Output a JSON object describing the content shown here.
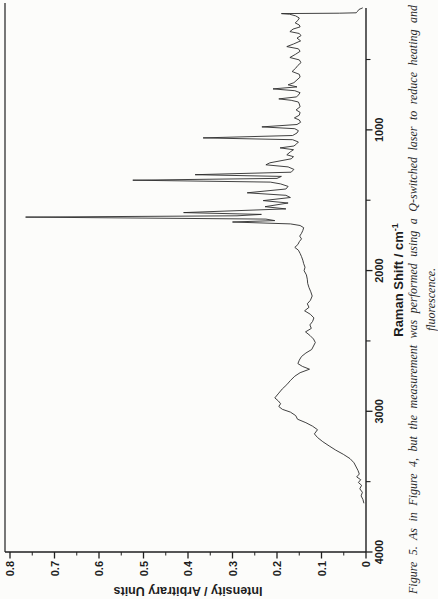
{
  "figure": {
    "caption_line1": "Figure 5. As in Figure 4, but the measurement was performed using a Q-switched laser to reduce heating and",
    "caption_line2": "fluorescence."
  },
  "colors": {
    "background": "#fcfcfa",
    "trace": "#2b2b2b",
    "axis": "#1f1f1f",
    "text": "#1d1d1d"
  },
  "chart_data": {
    "type": "line",
    "orientation_note": "figure printed rotated 90deg counterclockwise on page",
    "x_axis": {
      "title": "Raman Shift / cm",
      "title_superscript": "-1",
      "range": [
        4000,
        134
      ],
      "reversed": true,
      "major_ticks": [
        4000,
        3000,
        2000,
        1000
      ],
      "tick_labels": [
        "4000",
        "3000",
        "2000",
        "1000"
      ],
      "minor_ticks": [
        3500,
        2500,
        1500,
        500
      ]
    },
    "y_axis": {
      "title": "Intensity / Arbitrary Units",
      "range": [
        0,
        0.8
      ],
      "major_ticks": [
        0,
        0.1,
        0.2,
        0.3,
        0.4,
        0.5,
        0.6,
        0.7,
        0.8
      ],
      "tick_labels": [
        "0",
        "0.1",
        "0.2",
        "0.3",
        "0.4",
        "0.5",
        "0.6",
        "0.7",
        "0.8"
      ],
      "minor_tick_step": 0.05
    },
    "grid": false,
    "legend": false,
    "points": [
      [
        134,
        0.008
      ],
      [
        145,
        0.016
      ],
      [
        158,
        0.019
      ],
      [
        168,
        0.022
      ],
      [
        171,
        0.06
      ],
      [
        174,
        0.19
      ],
      [
        178,
        0.172
      ],
      [
        190,
        0.158
      ],
      [
        205,
        0.15
      ],
      [
        222,
        0.153
      ],
      [
        240,
        0.159
      ],
      [
        255,
        0.15
      ],
      [
        268,
        0.148
      ],
      [
        284,
        0.164
      ],
      [
        302,
        0.171
      ],
      [
        315,
        0.15
      ],
      [
        330,
        0.146
      ],
      [
        348,
        0.155
      ],
      [
        368,
        0.147
      ],
      [
        390,
        0.163
      ],
      [
        408,
        0.178
      ],
      [
        424,
        0.152
      ],
      [
        442,
        0.148
      ],
      [
        462,
        0.158
      ],
      [
        486,
        0.171
      ],
      [
        503,
        0.15
      ],
      [
        522,
        0.146
      ],
      [
        542,
        0.153
      ],
      [
        562,
        0.158
      ],
      [
        585,
        0.166
      ],
      [
        605,
        0.15
      ],
      [
        625,
        0.148
      ],
      [
        645,
        0.155
      ],
      [
        665,
        0.162
      ],
      [
        680,
        0.175
      ],
      [
        695,
        0.155
      ],
      [
        709,
        0.209
      ],
      [
        722,
        0.16
      ],
      [
        736,
        0.148
      ],
      [
        752,
        0.152
      ],
      [
        766,
        0.156
      ],
      [
        780,
        0.196
      ],
      [
        790,
        0.168
      ],
      [
        802,
        0.152
      ],
      [
        816,
        0.15
      ],
      [
        836,
        0.148
      ],
      [
        858,
        0.157
      ],
      [
        876,
        0.148
      ],
      [
        896,
        0.15
      ],
      [
        915,
        0.161
      ],
      [
        930,
        0.15
      ],
      [
        946,
        0.147
      ],
      [
        962,
        0.155
      ],
      [
        979,
        0.234
      ],
      [
        992,
        0.16
      ],
      [
        1006,
        0.152
      ],
      [
        1022,
        0.155
      ],
      [
        1040,
        0.165
      ],
      [
        1057,
        0.366
      ],
      [
        1070,
        0.165
      ],
      [
        1086,
        0.152
      ],
      [
        1100,
        0.156
      ],
      [
        1115,
        0.162
      ],
      [
        1128,
        0.193
      ],
      [
        1141,
        0.163
      ],
      [
        1156,
        0.17
      ],
      [
        1177,
        0.178
      ],
      [
        1191,
        0.163
      ],
      [
        1206,
        0.168
      ],
      [
        1234,
        0.216
      ],
      [
        1248,
        0.225
      ],
      [
        1263,
        0.175
      ],
      [
        1281,
        0.162
      ],
      [
        1301,
        0.168
      ],
      [
        1319,
        0.384
      ],
      [
        1331,
        0.19
      ],
      [
        1345,
        0.2
      ],
      [
        1358,
        0.524
      ],
      [
        1371,
        0.215
      ],
      [
        1384,
        0.192
      ],
      [
        1402,
        0.175
      ],
      [
        1420,
        0.18
      ],
      [
        1447,
        0.267
      ],
      [
        1465,
        0.18
      ],
      [
        1481,
        0.17
      ],
      [
        1503,
        0.231
      ],
      [
        1520,
        0.175
      ],
      [
        1546,
        0.227
      ],
      [
        1562,
        0.18
      ],
      [
        1588,
        0.41
      ],
      [
        1601,
        0.235
      ],
      [
        1611,
        0.29
      ],
      [
        1620,
        0.765
      ],
      [
        1634,
        0.225
      ],
      [
        1645,
        0.205
      ],
      [
        1655,
        0.3
      ],
      [
        1668,
        0.17
      ],
      [
        1680,
        0.148
      ],
      [
        1695,
        0.14
      ],
      [
        1715,
        0.142
      ],
      [
        1735,
        0.145
      ],
      [
        1755,
        0.149
      ],
      [
        1775,
        0.145
      ],
      [
        1795,
        0.15
      ],
      [
        1815,
        0.153
      ],
      [
        1835,
        0.16
      ],
      [
        1855,
        0.152
      ],
      [
        1878,
        0.148
      ],
      [
        1901,
        0.145
      ],
      [
        1926,
        0.142
      ],
      [
        1951,
        0.14
      ],
      [
        1976,
        0.137
      ],
      [
        2001,
        0.139
      ],
      [
        2031,
        0.134
      ],
      [
        2061,
        0.132
      ],
      [
        2091,
        0.131
      ],
      [
        2121,
        0.128
      ],
      [
        2151,
        0.124
      ],
      [
        2181,
        0.121
      ],
      [
        2211,
        0.125
      ],
      [
        2236,
        0.132
      ],
      [
        2261,
        0.128
      ],
      [
        2286,
        0.138
      ],
      [
        2311,
        0.125
      ],
      [
        2336,
        0.117
      ],
      [
        2361,
        0.12
      ],
      [
        2386,
        0.126
      ],
      [
        2411,
        0.123
      ],
      [
        2436,
        0.136
      ],
      [
        2461,
        0.126
      ],
      [
        2486,
        0.118
      ],
      [
        2511,
        0.114
      ],
      [
        2536,
        0.118
      ],
      [
        2561,
        0.122
      ],
      [
        2586,
        0.135
      ],
      [
        2611,
        0.145
      ],
      [
        2636,
        0.15
      ],
      [
        2661,
        0.153
      ],
      [
        2681,
        0.143
      ],
      [
        2701,
        0.127
      ],
      [
        2726,
        0.148
      ],
      [
        2751,
        0.16
      ],
      [
        2781,
        0.17
      ],
      [
        2811,
        0.178
      ],
      [
        2841,
        0.188
      ],
      [
        2871,
        0.196
      ],
      [
        2905,
        0.205
      ],
      [
        2926,
        0.197
      ],
      [
        2946,
        0.192
      ],
      [
        2966,
        0.196
      ],
      [
        2986,
        0.188
      ],
      [
        3006,
        0.17
      ],
      [
        3031,
        0.158
      ],
      [
        3056,
        0.154
      ],
      [
        3081,
        0.135
      ],
      [
        3106,
        0.12
      ],
      [
        3131,
        0.109
      ],
      [
        3161,
        0.116
      ],
      [
        3186,
        0.109
      ],
      [
        3216,
        0.097
      ],
      [
        3246,
        0.083
      ],
      [
        3276,
        0.068
      ],
      [
        3306,
        0.051
      ],
      [
        3336,
        0.036
      ],
      [
        3366,
        0.027
      ],
      [
        3396,
        0.022
      ],
      [
        3421,
        0.018
      ],
      [
        3446,
        0.015
      ],
      [
        3466,
        0.021
      ],
      [
        3486,
        0.012
      ],
      [
        3506,
        0.017
      ],
      [
        3526,
        0.01
      ],
      [
        3551,
        0.014
      ],
      [
        3576,
        0.008
      ],
      [
        3601,
        0.011
      ],
      [
        3626,
        0.007
      ],
      [
        3651,
        0.005
      ]
    ]
  }
}
